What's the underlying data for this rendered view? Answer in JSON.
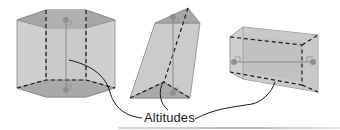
{
  "figure": {
    "label": "Altitudes",
    "shapes": [
      {
        "name": "hexagonal-prism",
        "orientation": "upright"
      },
      {
        "name": "triangular-prism",
        "orientation": "oblique"
      },
      {
        "name": "rectangular-prism",
        "orientation": "lying-on-side"
      }
    ],
    "colors": {
      "face_fill": "#c8c8c8",
      "base_fill": "#a9a9a9",
      "edge": "#8c8c8c",
      "hidden_edge": "#1a1a1a",
      "altitude": "#8a8a8a",
      "point": "#8f8f8f",
      "leader": "#1a1a1a"
    }
  }
}
